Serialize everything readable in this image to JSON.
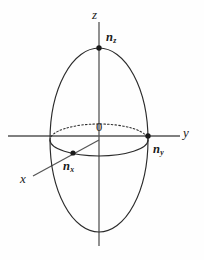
{
  "figure": {
    "name": "index-ellipsoid",
    "background_color": "#fefefe",
    "line_color": "#2b2b2b",
    "axis_color": "#555555"
  },
  "labels": {
    "z_axis": "z",
    "y_axis": "y",
    "x_axis": "x",
    "origin": "0",
    "n_z_base": "n",
    "n_z_sub": "z",
    "n_y_base": "n",
    "n_y_sub": "y",
    "n_x_base": "n",
    "n_x_sub": "x"
  },
  "geometry": {
    "center": {
      "x": 99,
      "y": 140
    },
    "main_ellipse": {
      "rx": 49,
      "ry": 92
    },
    "equator_ellipse": {
      "rx": 49,
      "ry": 16
    },
    "z_axis": {
      "x": 99,
      "y_top": 22,
      "y_bottom": 246
    },
    "y_axis": {
      "y": 136,
      "x_left": 8,
      "x_right": 180
    },
    "x_axis": {
      "x_start": 33,
      "y_start": 176,
      "x_end": 99,
      "y_end": 140
    }
  },
  "points": [
    {
      "name": "n_z",
      "x": 99,
      "y": 48
    },
    {
      "name": "n_y",
      "x": 148,
      "y": 136
    },
    {
      "name": "n_x",
      "x": 73,
      "y": 153
    }
  ],
  "label_positions": {
    "z_axis": {
      "x": 92,
      "y": 8
    },
    "n_z": {
      "x": 106,
      "y": 31
    },
    "y_axis": {
      "x": 183,
      "y": 126
    },
    "n_y": {
      "x": 153,
      "y": 143
    },
    "origin": {
      "x": 96,
      "y": 121
    },
    "n_x": {
      "x": 63,
      "y": 160
    },
    "x_axis": {
      "x": 20,
      "y": 172
    }
  }
}
